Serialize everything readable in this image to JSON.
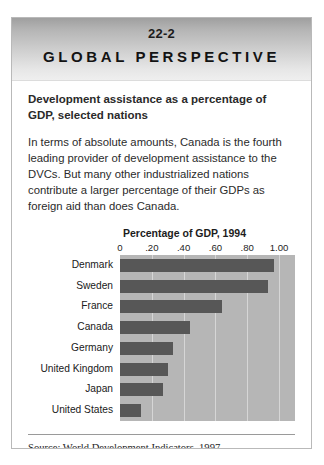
{
  "banner": {
    "number": "22-2",
    "title": "GLOBAL PERSPECTIVE"
  },
  "body": {
    "subtitle": "Development assistance as a percentage of GDP, selected nations",
    "paragraph": "In terms of absolute amounts, Canada is the fourth leading provider of development assistance to the DVCs. But many other industrialized nations contribute a larger percentage of their GDPs as foreign aid than does Canada."
  },
  "source": {
    "text": "Source: World Development Indicators, 1997."
  },
  "colors": {
    "bar": "#575757",
    "plot_background": "#b6b6b6",
    "gridline": "#d6d6d6",
    "banner_top": "#9f9f9f",
    "banner_bottom": "#efefef"
  },
  "chart_data": {
    "type": "bar",
    "orientation": "horizontal",
    "title": "Percentage of GDP, 1994",
    "xlabel": "",
    "ylabel": "",
    "categories": [
      "Denmark",
      "Sweden",
      "France",
      "Canada",
      "Germany",
      "United Kingdom",
      "Japan",
      "United States"
    ],
    "values": [
      0.97,
      0.93,
      0.64,
      0.44,
      0.33,
      0.3,
      0.27,
      0.13
    ],
    "xlim": [
      0,
      1.1
    ],
    "tick_values": [
      0,
      0.2,
      0.4,
      0.6,
      0.8,
      1.0
    ],
    "tick_labels": [
      "0",
      ".20",
      ".40",
      ".60",
      ".80",
      "1.00"
    ],
    "grid": true,
    "legend": "none"
  }
}
